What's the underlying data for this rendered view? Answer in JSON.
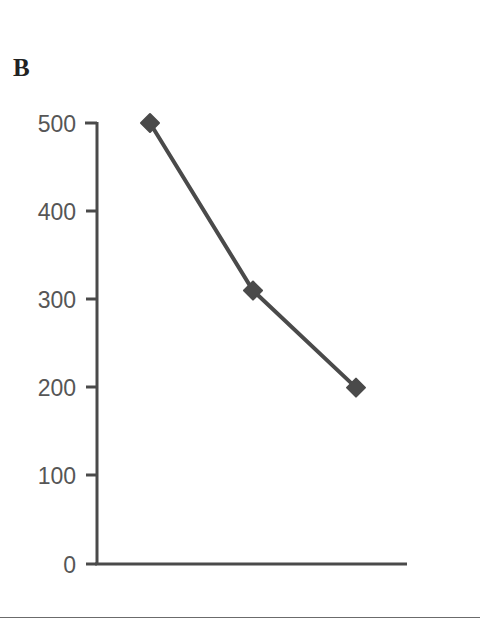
{
  "figure": {
    "panel_label": "B",
    "bottom_rule": true
  },
  "chart_data": {
    "type": "line",
    "title": "B",
    "xlabel": "",
    "ylabel": "",
    "x": [
      1,
      2,
      3
    ],
    "values": [
      500,
      310,
      200
    ],
    "series": [
      {
        "name": "series-1",
        "values": [
          500,
          310,
          200
        ],
        "marker": "diamond",
        "color": "#4a4a4a"
      }
    ],
    "ylim": [
      0,
      500
    ],
    "yticks": [
      0,
      100,
      200,
      300,
      400,
      500
    ],
    "ytick_labels": [
      "0",
      "100",
      "200",
      "300",
      "400",
      "500"
    ],
    "xticks": [],
    "xtick_labels": [],
    "grid": false,
    "legend": false,
    "axis_color": "#4a4a4a",
    "label_color": "#565656"
  },
  "axis": {
    "y_labels": {
      "t500": "500",
      "t400": "400",
      "t300": "300",
      "t200": "200",
      "t100": "100",
      "t0": "0"
    }
  }
}
